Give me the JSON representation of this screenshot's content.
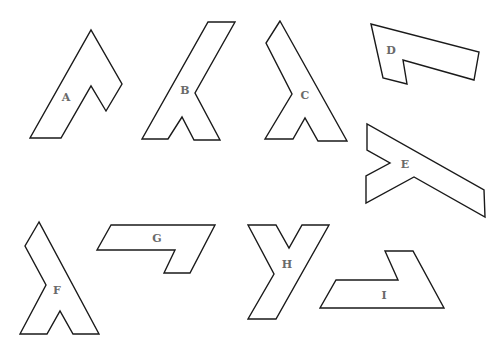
{
  "figure": {
    "title": "",
    "shapes": [
      {
        "label": "A",
        "points": "30,138 61,138 91,86 106,111 122,84 91,30",
        "label_x": 66,
        "label_y": 101
      },
      {
        "label": "B",
        "points": "142,139 168,139 182,117 194,140 220,140 195,93 235,22 208,22",
        "label_x": 185,
        "label_y": 94
      },
      {
        "label": "C",
        "points": "280,21 266,43 292,94 265,139 293,139 305,118 318,141 347,141",
        "label_x": 305,
        "label_y": 99
      },
      {
        "label": "D",
        "points": "371,24 383,78 407,84 403,60 474,80 479,52",
        "label_x": 391,
        "label_y": 54
      },
      {
        "label": "E",
        "points": "367,124 367,150 390,163 366,176 366,203 414,177 485,217 484,190",
        "label_x": 405,
        "label_y": 168
      },
      {
        "label": "F",
        "points": "39,222 25,246 46,285 20,334 47,334 60,311 73,334 99,334",
        "label_x": 57,
        "label_y": 294
      },
      {
        "label": "G",
        "points": "111,225 97,250 175,250 164,273 190,273 215,225",
        "label_x": 157,
        "label_y": 242
      },
      {
        "label": "H",
        "points": "248,225 276,225 289,248 302,225 329,225 276,319 248,319 274,274",
        "label_x": 287,
        "label_y": 268
      },
      {
        "label": "I",
        "points": "320,308 444,308 413,251 385,251 398,280 336,280",
        "label_x": 384,
        "label_y": 299
      }
    ]
  }
}
